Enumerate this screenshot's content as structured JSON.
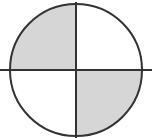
{
  "figure": {
    "shape_name": "circle",
    "background_color": "#ffffff",
    "outline_color": "#333333",
    "divider_color": "#333333",
    "shaded_fill_color": "#d6d6d6",
    "unshaded_fill_color": "#ffffff",
    "outline_width_px": 2,
    "divider_width_px": 2,
    "center_x": 76,
    "center_y": 70,
    "radius": 66,
    "shaded_count": 2,
    "total_parts": 4,
    "fraction_label": "2/4",
    "quadrants": [
      {
        "id": "top-left",
        "position": "top-left",
        "shaded": true,
        "fill": "#d6d6d6",
        "start_angle_deg": 180,
        "end_angle_deg": 270
      },
      {
        "id": "top-right",
        "position": "top-right",
        "shaded": false,
        "fill": "#ffffff",
        "start_angle_deg": 270,
        "end_angle_deg": 360
      },
      {
        "id": "bottom-right",
        "position": "bottom-right",
        "shaded": true,
        "fill": "#d6d6d6",
        "start_angle_deg": 0,
        "end_angle_deg": 90
      },
      {
        "id": "bottom-left",
        "position": "bottom-left",
        "shaded": false,
        "fill": "#ffffff",
        "start_angle_deg": 90,
        "end_angle_deg": 180
      }
    ],
    "dividers": [
      {
        "id": "vertical-divider",
        "orientation": "vertical",
        "x1": 76,
        "y1": 2,
        "x2": 76,
        "y2": 138
      },
      {
        "id": "horizontal-divider",
        "orientation": "horizontal",
        "x1": 0,
        "y1": 70,
        "x2": 152,
        "y2": 70
      }
    ]
  }
}
